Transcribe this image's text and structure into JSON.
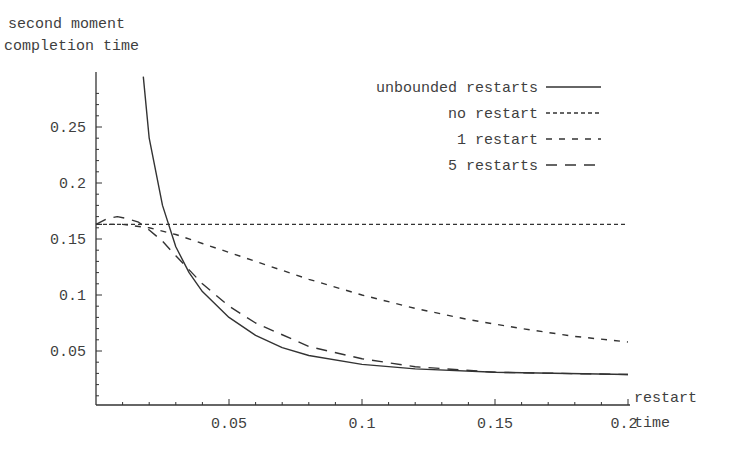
{
  "chart_data": {
    "type": "line",
    "title": "",
    "ylabel": "second moment completion time",
    "ylabel_lines": [
      "second moment",
      "completion time"
    ],
    "xlabel": "restart time",
    "xlabel_lines": [
      "restart",
      "time"
    ],
    "xlim": [
      0,
      0.2
    ],
    "ylim": [
      0,
      0.3
    ],
    "grid": false,
    "legend_position": "upper-right",
    "x_ticks": [
      0.05,
      0.1,
      0.15,
      0.2
    ],
    "x_tick_labels": [
      "0.05",
      "0.1",
      "0.15",
      "0.2"
    ],
    "y_ticks": [
      0.05,
      0.1,
      0.15,
      0.2,
      0.25
    ],
    "y_tick_labels": [
      "0.05",
      "0.1",
      "0.15",
      "0.2",
      "0.25"
    ],
    "series": [
      {
        "name": "unbounded restarts",
        "style": "solid",
        "x": [
          0.0178,
          0.02,
          0.025,
          0.03,
          0.035,
          0.04,
          0.05,
          0.06,
          0.07,
          0.08,
          0.1,
          0.12,
          0.15,
          0.2
        ],
        "y": [
          0.295,
          0.24,
          0.18,
          0.143,
          0.12,
          0.103,
          0.08,
          0.064,
          0.053,
          0.046,
          0.038,
          0.034,
          0.031,
          0.029
        ]
      },
      {
        "name": "no restart",
        "style": "fine-dash",
        "x": [
          0,
          0.2
        ],
        "y": [
          0.163,
          0.163
        ]
      },
      {
        "name": "1 restart",
        "style": "short-dash",
        "x": [
          0,
          0.01,
          0.02,
          0.03,
          0.04,
          0.05,
          0.06,
          0.08,
          0.1,
          0.12,
          0.14,
          0.16,
          0.18,
          0.2
        ],
        "y": [
          0.163,
          0.163,
          0.16,
          0.154,
          0.146,
          0.138,
          0.13,
          0.114,
          0.1,
          0.088,
          0.078,
          0.07,
          0.063,
          0.058
        ]
      },
      {
        "name": "5 restarts",
        "style": "long-dash",
        "x": [
          0,
          0.004,
          0.008,
          0.012,
          0.016,
          0.02,
          0.025,
          0.03,
          0.04,
          0.05,
          0.06,
          0.08,
          0.1,
          0.12,
          0.15,
          0.2
        ],
        "y": [
          0.163,
          0.168,
          0.17,
          0.168,
          0.165,
          0.158,
          0.148,
          0.135,
          0.11,
          0.09,
          0.075,
          0.054,
          0.043,
          0.036,
          0.031,
          0.029
        ]
      }
    ]
  },
  "legend": {
    "items": [
      {
        "label": "unbounded restarts",
        "style": "solid"
      },
      {
        "label": "no restart",
        "style": "fine-dash"
      },
      {
        "label": "1 restart",
        "style": "short-dash"
      },
      {
        "label": "5 restarts",
        "style": "long-dash"
      }
    ]
  },
  "axes": {
    "y_title_line1": "second moment",
    "y_title_line2": "completion time",
    "x_title_line1": "restart",
    "x_title_line2": "time"
  },
  "colors": {
    "line": "#333333",
    "text": "#3f3f3f",
    "background": "#ffffff"
  }
}
